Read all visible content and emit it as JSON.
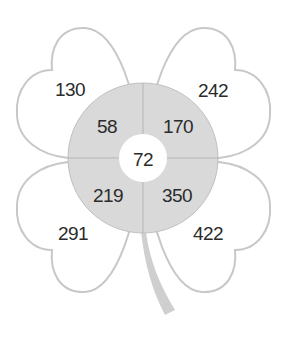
{
  "diagram": {
    "type": "clover-number-diagram",
    "colors": {
      "leaf_fill": "#ffffff",
      "leaf_stroke": "#c8c8c8",
      "ring_fill": "#d9d9d9",
      "ring_stroke": "#b5b5b5",
      "stem": "#cfcfcf",
      "text": "#2b2b2b"
    },
    "center": "72",
    "ring": {
      "top_left": "58",
      "top_right": "170",
      "bottom_left": "219",
      "bottom_right": "350"
    },
    "leaves": {
      "top_left": "130",
      "top_right": "242",
      "bottom_left": "291",
      "bottom_right": "422"
    }
  }
}
